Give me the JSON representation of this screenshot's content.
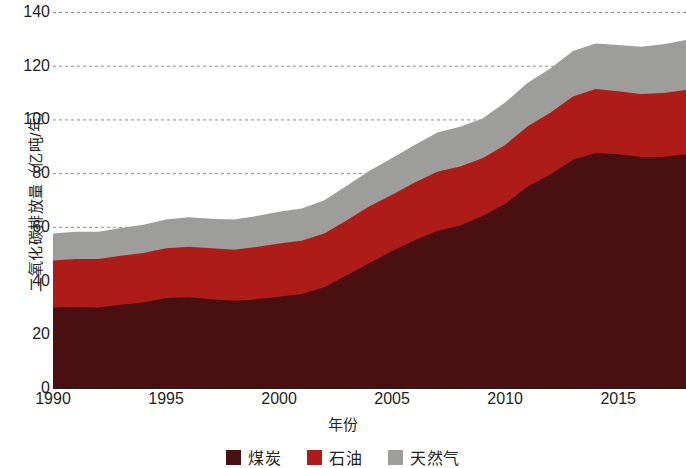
{
  "chart_data": {
    "type": "area",
    "stacked": true,
    "title": "",
    "xlabel": "年份",
    "ylabel": "二氧化碳排放量（亿吨/年）",
    "xlim": [
      1990,
      2018
    ],
    "ylim": [
      0,
      140
    ],
    "y_ticks": [
      0,
      20,
      40,
      60,
      80,
      100,
      120,
      140
    ],
    "x_ticks": [
      1990,
      1995,
      2000,
      2005,
      2010,
      2015
    ],
    "grid": "horizontal-dashed",
    "legend_position": "bottom-center",
    "x": [
      1990,
      1991,
      1992,
      1993,
      1994,
      1995,
      1996,
      1997,
      1998,
      1999,
      2000,
      2001,
      2002,
      2003,
      2004,
      2005,
      2006,
      2007,
      2008,
      2009,
      2010,
      2011,
      2012,
      2013,
      2014,
      2015,
      2016,
      2017,
      2018
    ],
    "series": [
      {
        "name": "煤炭",
        "color": "#4a0f10",
        "values": [
          30.0,
          30.2,
          30.0,
          31.0,
          31.8,
          33.5,
          33.8,
          33.0,
          32.5,
          33.0,
          34.0,
          35.0,
          37.5,
          42.0,
          46.5,
          51.0,
          55.0,
          58.5,
          60.5,
          64.0,
          68.5,
          75.0,
          79.5,
          85.0,
          87.5,
          87.0,
          86.0,
          86.0,
          87.0
        ]
      },
      {
        "name": "石油",
        "color": "#ae1c18",
        "values": [
          17.5,
          17.8,
          18.0,
          18.2,
          18.5,
          18.5,
          18.8,
          19.0,
          19.0,
          19.5,
          19.8,
          19.8,
          20.0,
          20.5,
          21.2,
          21.0,
          21.5,
          22.0,
          22.0,
          21.5,
          22.0,
          22.5,
          23.0,
          23.5,
          23.8,
          23.5,
          23.5,
          23.8,
          24.0
        ]
      },
      {
        "name": "天然气",
        "color": "#9d9d9c",
        "values": [
          10.0,
          10.2,
          10.2,
          10.4,
          10.5,
          10.7,
          11.0,
          11.0,
          11.2,
          11.5,
          11.8,
          12.0,
          12.4,
          12.8,
          13.2,
          13.6,
          14.0,
          14.6,
          14.8,
          14.8,
          15.8,
          16.2,
          16.5,
          17.0,
          17.0,
          17.2,
          17.6,
          18.2,
          18.6
        ]
      }
    ],
    "stack_tops": {
      "coal": [
        30.0,
        30.2,
        30.0,
        31.0,
        31.8,
        33.5,
        33.8,
        33.0,
        32.5,
        33.0,
        34.0,
        35.0,
        37.5,
        42.0,
        46.5,
        51.0,
        55.0,
        58.5,
        60.5,
        64.0,
        68.5,
        75.0,
        79.5,
        85.0,
        87.5,
        87.0,
        86.0,
        86.0,
        87.0
      ],
      "oil": [
        47.5,
        48.0,
        48.0,
        49.2,
        50.3,
        52.0,
        52.6,
        52.0,
        51.5,
        52.5,
        53.8,
        54.8,
        57.5,
        62.5,
        67.7,
        72.0,
        76.5,
        80.5,
        82.5,
        85.5,
        90.5,
        97.5,
        102.5,
        108.5,
        111.3,
        110.5,
        109.5,
        109.8,
        111.0
      ],
      "gas": [
        57.5,
        58.2,
        58.2,
        59.6,
        60.8,
        62.7,
        63.6,
        63.0,
        62.7,
        64.0,
        65.6,
        66.8,
        69.9,
        75.3,
        80.9,
        85.6,
        90.5,
        95.1,
        97.3,
        100.3,
        106.3,
        113.7,
        119.0,
        125.5,
        128.3,
        127.7,
        127.1,
        128.0,
        129.6
      ]
    }
  },
  "axes": {
    "y_title": "二氧化碳排放量（亿吨/年）",
    "x_title": "年份",
    "y_tick_labels": [
      "140",
      "120",
      "100",
      "80",
      "60",
      "40",
      "20",
      "0"
    ],
    "x_tick_labels": [
      "1990",
      "1995",
      "2000",
      "2005",
      "2010",
      "2015"
    ]
  },
  "legend": {
    "items": [
      {
        "label": "煤炭",
        "color": "#4a0f10"
      },
      {
        "label": "石油",
        "color": "#ae1c18"
      },
      {
        "label": "天然气",
        "color": "#9d9d9c"
      }
    ]
  },
  "style": {
    "background": "#ffffff",
    "text_color": "#231f20",
    "grid_color": "#8f8f8f"
  }
}
